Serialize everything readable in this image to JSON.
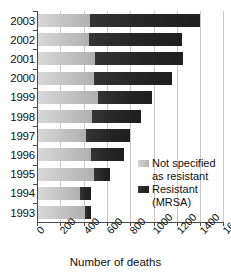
{
  "chart_data": {
    "type": "bar",
    "orientation": "horizontal",
    "stacked": true,
    "title": "",
    "xlabel": "Number of deaths",
    "ylabel": "",
    "xlim": [
      0,
      1600
    ],
    "xticks": [
      0,
      200,
      400,
      600,
      800,
      1000,
      1200,
      1400,
      1600
    ],
    "xtick_labels": [
      "0",
      "200",
      "400",
      "600",
      "800",
      "1000",
      "1200",
      "1400",
      "1600"
    ],
    "grid": true,
    "grid_axis": "x",
    "legend_position": "inside-right",
    "categories": [
      "2003",
      "2002",
      "2001",
      "2000",
      "1999",
      "1998",
      "1997",
      "1996",
      "1995",
      "1994",
      "1993"
    ],
    "series": [
      {
        "name": "Not specified as resistant",
        "color": "#c6c6c6",
        "values": [
          455,
          445,
          495,
          490,
          520,
          470,
          420,
          460,
          490,
          370,
          415
        ]
      },
      {
        "name": "Resistant (MRSA)",
        "color": "#262626",
        "values": [
          945,
          800,
          760,
          670,
          470,
          420,
          380,
          285,
          135,
          95,
          45
        ]
      }
    ],
    "totals": [
      1400,
      1245,
      1255,
      1160,
      990,
      890,
      800,
      745,
      625,
      465,
      460
    ]
  },
  "axis": {
    "x_title": "Number of deaths",
    "y_labels": [
      "2003",
      "2002",
      "2001",
      "2000",
      "1999",
      "1998",
      "1997",
      "1996",
      "1995",
      "1994",
      "1993"
    ],
    "x_tick_labels": [
      "0",
      "200",
      "400",
      "600",
      "800",
      "1000",
      "1200",
      "1400",
      "1600"
    ]
  },
  "legend": {
    "items": [
      {
        "label_line1": "Not specified",
        "label_line2": "as resistant",
        "swatch": "light-gray-swatch"
      },
      {
        "label_line1": "Resistant",
        "label_line2": "(MRSA)",
        "swatch": "dark-swatch"
      }
    ]
  }
}
